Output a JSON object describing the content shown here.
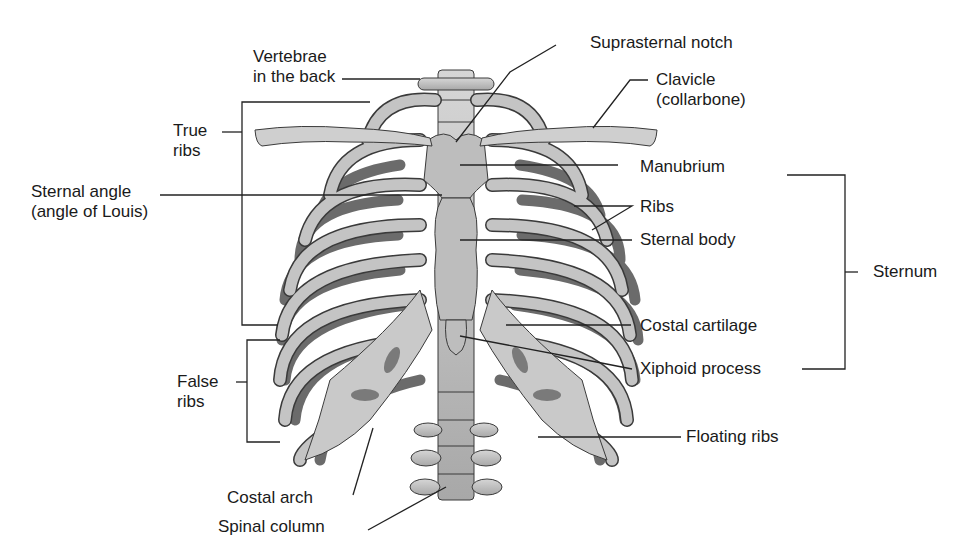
{
  "diagram": {
    "colors": {
      "bone_light": "#c9c9c9",
      "bone_mid": "#a9a9a9",
      "bone_dark": "#6b6b6b",
      "outline": "#3a3a3a",
      "text": "#1a1a1a",
      "leader": "#222222"
    },
    "labels": {
      "vertebrae": {
        "line1": "Vertebrae",
        "line2": "in the back"
      },
      "suprasternal_notch": "Suprasternal notch",
      "clavicle": {
        "line1": "Clavicle",
        "line2": "(collarbone)"
      },
      "true_ribs": {
        "line1": "True",
        "line2": "ribs"
      },
      "sternal_angle": {
        "line1": "Sternal angle",
        "line2": "(angle of Louis)"
      },
      "manubrium": "Manubrium",
      "ribs": "Ribs",
      "sternal_body": "Sternal body",
      "sternum": "Sternum",
      "costal_cartilage": "Costal cartilage",
      "xiphoid_process": "Xiphoid process",
      "false_ribs": {
        "line1": "False",
        "line2": "ribs"
      },
      "floating_ribs": "Floating ribs",
      "costal_arch": "Costal arch",
      "spinal_column": "Spinal column"
    }
  }
}
